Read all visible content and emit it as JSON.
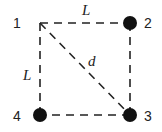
{
  "diagram": {
    "nodes": [
      {
        "id": "1",
        "label": "1",
        "x": 40,
        "y": 23,
        "filled": false
      },
      {
        "id": "2",
        "label": "2",
        "x": 130,
        "y": 23,
        "filled": true
      },
      {
        "id": "3",
        "label": "3",
        "x": 130,
        "y": 115,
        "filled": true
      },
      {
        "id": "4",
        "label": "4",
        "x": 40,
        "y": 115,
        "filled": true
      }
    ],
    "edges": [
      {
        "from": "1",
        "to": "2",
        "label": "L",
        "style": "dashed"
      },
      {
        "from": "2",
        "to": "3",
        "label": "",
        "style": "dashed"
      },
      {
        "from": "3",
        "to": "4",
        "label": "",
        "style": "dashed"
      },
      {
        "from": "4",
        "to": "1",
        "label": "L",
        "style": "dashed"
      },
      {
        "from": "1",
        "to": "3",
        "label": "d",
        "style": "dashed"
      }
    ],
    "labels": {
      "top_edge": "L",
      "left_edge": "L",
      "diagonal": "d",
      "node1": "1",
      "node2": "2",
      "node3": "3",
      "node4": "4"
    },
    "colors": {
      "stroke": "#222222",
      "node_fill": "#111111"
    }
  }
}
